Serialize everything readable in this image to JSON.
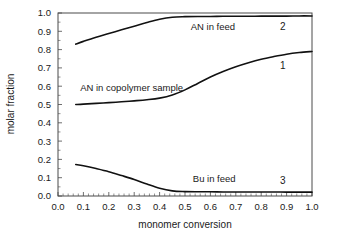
{
  "chart_data": {
    "type": "line",
    "title": "",
    "subtitle": "",
    "xlabel": "monomer conversion",
    "ylabel": "molar fraction",
    "xlim": [
      0.0,
      1.0
    ],
    "ylim": [
      0.0,
      1.0
    ],
    "grid": false,
    "legend_position": "inline-annotations",
    "x_ticks": [
      "0.0",
      "0.1",
      "0.2",
      "0.3",
      "0.4",
      "0.5",
      "0.6",
      "0.7",
      "0.8",
      "0.9",
      "1.0"
    ],
    "y_ticks": [
      "0.0",
      "0.1",
      "0.2",
      "0.3",
      "0.4",
      "0.5",
      "0.6",
      "0.7",
      "0.8",
      "0.9",
      "1.0"
    ],
    "x_tick_values": [
      0.0,
      0.1,
      0.2,
      0.3,
      0.4,
      0.5,
      0.6,
      0.7,
      0.8,
      0.9,
      1.0
    ],
    "y_tick_values": [
      0.0,
      0.1,
      0.2,
      0.3,
      0.4,
      0.5,
      0.6,
      0.7,
      0.8,
      0.9,
      1.0
    ],
    "x": [
      0.07,
      0.1,
      0.15,
      0.2,
      0.25,
      0.3,
      0.35,
      0.4,
      0.45,
      0.5,
      0.55,
      0.6,
      0.65,
      0.7,
      0.75,
      0.8,
      0.85,
      0.9,
      0.95,
      1.0
    ],
    "series": [
      {
        "name": "AN in copolymer sample",
        "number": "1",
        "color": "#111111",
        "values": [
          0.5,
          0.502,
          0.506,
          0.51,
          0.515,
          0.52,
          0.526,
          0.535,
          0.552,
          0.58,
          0.615,
          0.65,
          0.68,
          0.706,
          0.728,
          0.747,
          0.762,
          0.775,
          0.784,
          0.79
        ]
      },
      {
        "name": "AN in feed",
        "number": "2",
        "color": "#111111",
        "values": [
          0.83,
          0.845,
          0.868,
          0.888,
          0.908,
          0.928,
          0.948,
          0.966,
          0.977,
          0.98,
          0.981,
          0.981,
          0.982,
          0.982,
          0.982,
          0.983,
          0.983,
          0.983,
          0.984,
          0.984
        ]
      },
      {
        "name": "Bu in feed",
        "number": "3",
        "color": "#111111",
        "values": [
          0.172,
          0.165,
          0.15,
          0.133,
          0.112,
          0.09,
          0.065,
          0.042,
          0.028,
          0.024,
          0.023,
          0.023,
          0.022,
          0.022,
          0.022,
          0.022,
          0.022,
          0.021,
          0.021,
          0.021
        ]
      }
    ],
    "annotations": [
      {
        "text": "AN in feed",
        "x": 0.61,
        "y": 0.925,
        "series": "2"
      },
      {
        "text": "2",
        "x": 0.885,
        "y": 0.925,
        "series": "2"
      },
      {
        "text": "AN in copolymer sample",
        "x": 0.29,
        "y": 0.595,
        "series": "1"
      },
      {
        "text": "1",
        "x": 0.885,
        "y": 0.715,
        "series": "1"
      },
      {
        "text": "Bu in feed",
        "x": 0.615,
        "y": 0.095,
        "series": "3"
      },
      {
        "text": "3",
        "x": 0.885,
        "y": 0.085,
        "series": "3"
      }
    ]
  }
}
